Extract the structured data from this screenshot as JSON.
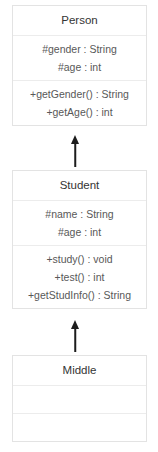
{
  "diagram": {
    "type": "uml-class-diagram",
    "relationship": "generalization",
    "classes": [
      {
        "name": "Person",
        "attributes": [
          "#gender : String",
          "#age : int"
        ],
        "methods": [
          "+getGender() : String",
          "+getAge() : int"
        ]
      },
      {
        "name": "Student",
        "attributes": [
          "#name : String",
          "#age : int"
        ],
        "methods": [
          "+study() : void",
          "+test() : int",
          "+getStudInfo() : String"
        ]
      },
      {
        "name": "Middle",
        "attributes": [],
        "methods": []
      }
    ],
    "arrows": [
      {
        "from": "Student",
        "to": "Person",
        "kind": "inheritance-arrow-up"
      },
      {
        "from": "Middle",
        "to": "Student",
        "kind": "inheritance-arrow-up"
      }
    ],
    "colors": {
      "box_border": "#e3e3e3",
      "divider": "#ececec",
      "title_text": "#343434",
      "member_text": "#585858",
      "arrow": "#1c1c1c",
      "background": "#ffffff"
    }
  }
}
